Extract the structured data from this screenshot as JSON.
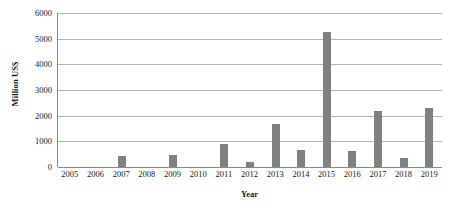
{
  "chart_data": {
    "type": "bar",
    "title": "",
    "xlabel": "Year",
    "ylabel": "Million US$",
    "categories": [
      "2005",
      "2006",
      "2007",
      "2008",
      "2009",
      "2010",
      "2011",
      "2012",
      "2013",
      "2014",
      "2015",
      "2016",
      "2017",
      "2018",
      "2019"
    ],
    "values": [
      0,
      0,
      430,
      0,
      480,
      0,
      890,
      200,
      1670,
      660,
      5270,
      620,
      2170,
      350,
      2300
    ],
    "series": [
      {
        "name": "Million US$",
        "values": [
          0,
          0,
          430,
          0,
          480,
          0,
          890,
          200,
          1670,
          660,
          5270,
          620,
          2170,
          350,
          2300
        ]
      }
    ],
    "ylim": [
      0,
      6000
    ],
    "y_ticks": [
      0,
      1000,
      2000,
      3000,
      4000,
      5000,
      6000
    ],
    "y_tick_labels": [
      "0",
      "1000",
      "2000",
      "3000",
      "4000",
      "5000",
      "6000"
    ],
    "grid": true,
    "legend": false,
    "legend_position": "none",
    "bar_color": "#808080",
    "gridline_color": "#b4b4b4",
    "axis_color": "#8a8a8a",
    "background_color": "#ffffff"
  }
}
